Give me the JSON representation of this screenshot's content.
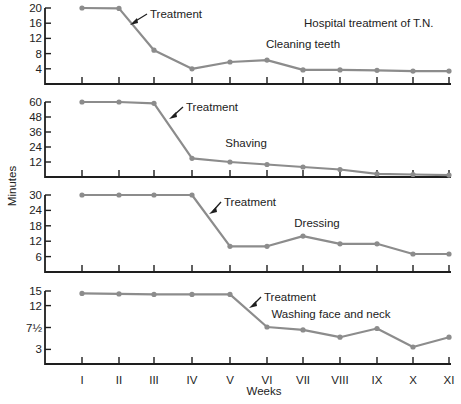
{
  "chart_data": [
    {
      "type": "line",
      "title": "Hospital treatment of T.N.",
      "series_label": "Cleaning teeth",
      "annotation": "Treatment",
      "annotation_between": [
        "II",
        "III"
      ],
      "xlabel": "Weeks",
      "ylabel": "Minutes",
      "categories": [
        "I",
        "II",
        "III",
        "IV",
        "V",
        "VI",
        "VII",
        "VIII",
        "IX",
        "X",
        "XI"
      ],
      "values": [
        20,
        19.9,
        8.9,
        4,
        5.8,
        6.3,
        3.7,
        3.7,
        3.6,
        3.4,
        3.4
      ],
      "yticks": [
        4,
        8,
        12,
        16,
        20
      ],
      "ytick_labels": [
        "4",
        "8",
        "12",
        "16",
        "20"
      ],
      "ylim": [
        0,
        20
      ],
      "grid": false
    },
    {
      "type": "line",
      "series_label": "Shaving",
      "annotation": "Treatment",
      "annotation_between": [
        "III",
        "IV"
      ],
      "xlabel": "Weeks",
      "ylabel": "Minutes",
      "categories": [
        "I",
        "II",
        "III",
        "IV",
        "V",
        "VI",
        "VII",
        "VIII",
        "IX",
        "X",
        "XI"
      ],
      "values": [
        60,
        60,
        59,
        15,
        12,
        10,
        8,
        6,
        2.5,
        2,
        1.5
      ],
      "yticks": [
        12,
        24,
        36,
        48,
        60
      ],
      "ytick_labels": [
        "12",
        "24",
        "36",
        "48",
        "60"
      ],
      "ylim": [
        0,
        60
      ],
      "grid": false
    },
    {
      "type": "line",
      "series_label": "Dressing",
      "annotation": "Treatment",
      "annotation_between": [
        "IV",
        "V"
      ],
      "xlabel": "Weeks",
      "ylabel": "Minutes",
      "categories": [
        "I",
        "II",
        "III",
        "IV",
        "V",
        "VI",
        "VII",
        "VIII",
        "IX",
        "X",
        "XI"
      ],
      "values": [
        30,
        30,
        30,
        30,
        10,
        10,
        14,
        11,
        11,
        7,
        7
      ],
      "yticks": [
        6,
        12,
        18,
        24,
        30
      ],
      "ytick_labels": [
        "6",
        "12",
        "18",
        "24",
        "30"
      ],
      "ylim": [
        0,
        30
      ],
      "grid": false
    },
    {
      "type": "line",
      "series_label": "Washing face and neck",
      "annotation": "Treatment",
      "annotation_between": [
        "V",
        "VI"
      ],
      "xlabel": "Weeks",
      "ylabel": "Minutes",
      "categories": [
        "I",
        "II",
        "III",
        "IV",
        "V",
        "VI",
        "VII",
        "VIII",
        "IX",
        "X",
        "XI"
      ],
      "values": [
        14.5,
        14.4,
        14.3,
        14.3,
        14.3,
        7.6,
        7,
        5.5,
        7.3,
        3.5,
        5.5
      ],
      "yticks": [
        3,
        7.5,
        12,
        15
      ],
      "ytick_labels": [
        "3",
        "7½",
        "12",
        "15"
      ],
      "ylim": [
        0,
        15
      ],
      "grid": false
    }
  ],
  "figure": {
    "title": "Hospital treatment of T.N.",
    "xlabel": "Weeks",
    "ylabel": "Minutes",
    "x_tick_labels": [
      "I",
      "II",
      "III",
      "IV",
      "V",
      "VI",
      "VII",
      "VIII",
      "IX",
      "X",
      "XI"
    ],
    "line_color": "#8c8c8c",
    "axis_color": "#1e1e1e"
  }
}
